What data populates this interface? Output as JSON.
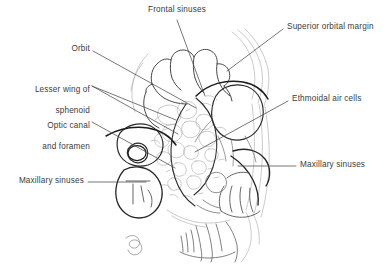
{
  "figure": {
    "background_color": "#ffffff",
    "ink_color": "#3b3b3b",
    "bold_ink_color": "#1a1a1a",
    "faint_ink_color": "#9a9a9a",
    "leader_color": "#4a4a4a"
  },
  "labels": {
    "frontal_sinuses": "Frontal sinuses",
    "superior_orbital_margin": "Superior orbital margin",
    "orbit": "Orbit",
    "lesser_wing_of_sphenoid_line1": "Lesser wing of",
    "lesser_wing_of_sphenoid_line2": "sphenoid",
    "optic_canal_line1": "Optic canal",
    "optic_canal_line2": "and foramen",
    "ethmoidal_air_cells": "Ethmoidal air cells",
    "maxillary_sinuses_left": "Maxillary sinuses",
    "maxillary_sinuses_right": "Maxillary sinuses"
  }
}
